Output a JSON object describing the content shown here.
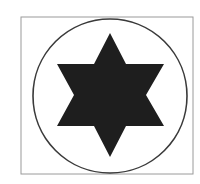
{
  "figure": {
    "symbol": "six-pointed-star",
    "colors": {
      "background": "#ffffff",
      "frame_stroke": "#9a9a9a",
      "circle_stroke": "#3a3a3a",
      "star_fill": "#1e1e1e"
    },
    "frame": {
      "x": 21,
      "y": 17,
      "width": 172,
      "height": 157
    },
    "circle": {
      "cx": 110,
      "cy": 96,
      "r": 77
    },
    "star": {
      "points": "110,33 126,64 164,64 146,95 164,126 126,126 110,157 94,126 57,126 74,95 57,64 94,64"
    }
  }
}
